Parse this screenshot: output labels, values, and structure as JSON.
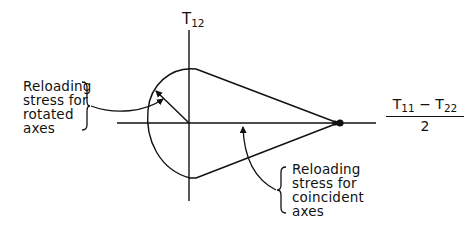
{
  "diagram": {
    "type": "stress-space diagram",
    "vertical_axis": {
      "symbol": "T",
      "subscript": "12"
    },
    "horizontal_axis": {
      "numerator_a_symbol": "T",
      "numerator_a_subscript": "11",
      "operator": "−",
      "numerator_b_symbol": "T",
      "numerator_b_subscript": "22",
      "denominator": "2"
    },
    "annotations": [
      {
        "id": "rotated",
        "lines": [
          "Reloading",
          "stress for",
          "rotated",
          "axes"
        ]
      },
      {
        "id": "coincident",
        "lines": [
          "Reloading",
          "stress for",
          "coincident",
          "axes"
        ]
      }
    ],
    "colors": {
      "ink": "#111111",
      "background": "#ffffff"
    }
  }
}
